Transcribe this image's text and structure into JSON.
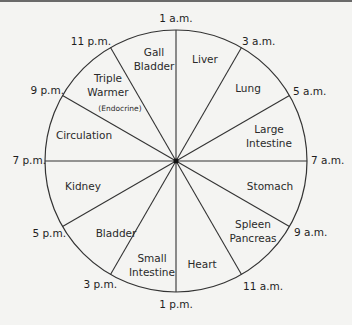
{
  "diagram": {
    "center": {
      "x": 176,
      "y": 161
    },
    "radius": 131,
    "line_color": "#333333",
    "background": "#f4f4f2",
    "times": [
      {
        "label": "1 a.m.",
        "x": 176,
        "y": 22,
        "anchor": "middle"
      },
      {
        "label": "3 a.m.",
        "x": 242,
        "y": 45,
        "anchor": "start"
      },
      {
        "label": "5 a.m.",
        "x": 293,
        "y": 95,
        "anchor": "start"
      },
      {
        "label": "7 a.m.",
        "x": 311,
        "y": 164,
        "anchor": "start"
      },
      {
        "label": "9 a.m.",
        "x": 294,
        "y": 236,
        "anchor": "start"
      },
      {
        "label": "11 a.m.",
        "x": 243,
        "y": 290,
        "anchor": "start"
      },
      {
        "label": "1 p.m.",
        "x": 176,
        "y": 308,
        "anchor": "middle"
      },
      {
        "label": "3 p.m.",
        "x": 117,
        "y": 288,
        "anchor": "end"
      },
      {
        "label": "5 p.m.",
        "x": 66,
        "y": 237,
        "anchor": "end"
      },
      {
        "label": "7 p.m.",
        "x": 46,
        "y": 164,
        "anchor": "end"
      },
      {
        "label": "9 p.m.",
        "x": 64,
        "y": 94,
        "anchor": "end"
      },
      {
        "label": "11 p.m.",
        "x": 111,
        "y": 45,
        "anchor": "end"
      }
    ],
    "organs": [
      {
        "lines": [
          "Liver"
        ],
        "x": 205,
        "y": 63
      },
      {
        "lines": [
          "Lung"
        ],
        "x": 248,
        "y": 92
      },
      {
        "lines": [
          "Large",
          "Intestine"
        ],
        "x": 269,
        "y": 133
      },
      {
        "lines": [
          "Stomach"
        ],
        "x": 270,
        "y": 190
      },
      {
        "lines": [
          "Spleen",
          "Pancreas"
        ],
        "x": 253,
        "y": 228
      },
      {
        "lines": [
          "Heart"
        ],
        "x": 202,
        "y": 268
      },
      {
        "lines": [
          "Small",
          "Intestine"
        ],
        "x": 152,
        "y": 262
      },
      {
        "lines": [
          "Bladder"
        ],
        "x": 116,
        "y": 237
      },
      {
        "lines": [
          "Kidney"
        ],
        "x": 83,
        "y": 190
      },
      {
        "lines": [
          "Circulation"
        ],
        "x": 84,
        "y": 139
      },
      {
        "lines": [
          "Triple",
          "Warmer"
        ],
        "x": 108,
        "y": 82
      },
      {
        "lines": [
          "Gall",
          "Bladder"
        ],
        "x": 154,
        "y": 56
      }
    ],
    "note": {
      "label": "(Endocrine)",
      "x": 120,
      "y": 111
    }
  }
}
